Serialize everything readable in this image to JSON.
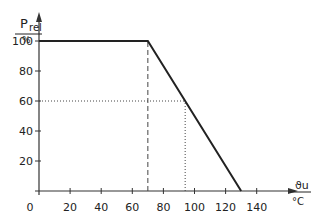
{
  "chart_data": {
    "type": "line",
    "title": "",
    "xlabel": "ϑu / °C",
    "ylabel": "P_rel / %",
    "y_label_main": "P",
    "y_label_sub": "rel",
    "y_unit": "%",
    "x_label_main": "ϑu",
    "x_unit": "°C",
    "xlim": [
      0,
      150
    ],
    "ylim": [
      0,
      110
    ],
    "x_ticks": [
      0,
      20,
      40,
      60,
      80,
      100,
      120,
      140
    ],
    "y_ticks": [
      20,
      40,
      60,
      80,
      100
    ],
    "series": [
      {
        "name": "P_rel derating",
        "x": [
          0,
          70,
          130
        ],
        "y": [
          100,
          100,
          0
        ],
        "style": "solid"
      }
    ],
    "annotations": [
      {
        "type": "dashed-vertical",
        "x": 70,
        "y_from": 0,
        "y_to": 100
      },
      {
        "type": "dotted-horizontal",
        "y": 60,
        "x_from": 0,
        "x_to": 94
      },
      {
        "type": "dotted-vertical",
        "x": 94,
        "y_from": 0,
        "y_to": 60
      }
    ],
    "grid": false,
    "legend": null
  }
}
